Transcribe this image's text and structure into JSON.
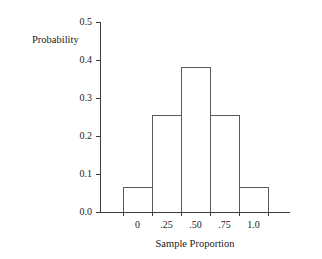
{
  "chart_data": {
    "type": "bar",
    "title": "",
    "xlabel": "Sample Proportion",
    "ylabel": "Probability",
    "categories": [
      "0",
      ".25",
      ".50",
      ".75",
      "1.0"
    ],
    "values": [
      0.065,
      0.255,
      0.38,
      0.255,
      0.065
    ],
    "ylim": [
      0.0,
      0.5
    ],
    "ytick_labels": [
      "0.0",
      "0.1",
      "0.2",
      "0.3",
      "0.4",
      "0.5"
    ],
    "ytick_values": [
      0.0,
      0.1,
      0.2,
      0.3,
      0.4,
      0.5
    ],
    "xtick_labels": [
      "0",
      ".25",
      ".50",
      ".75",
      "1.0"
    ],
    "grid": false,
    "legend": null,
    "bar_fill": "#ffffff",
    "bar_stroke": "#5a5a5a",
    "axis_color": "#3c3c3c",
    "text_color": "#1a1a1a",
    "background": "#ffffff"
  },
  "labels": {
    "y_axis_title": "Probability",
    "x_axis_title": "Sample Proportion"
  }
}
